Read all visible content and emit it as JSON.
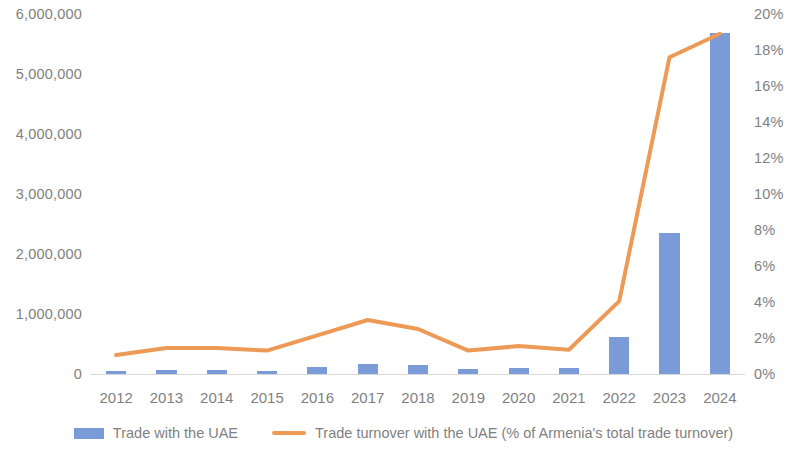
{
  "chart_data": {
    "type": "bar",
    "title": "",
    "subtitle": "",
    "xlabel": "",
    "ylabel": "",
    "y2label": "",
    "grid": false,
    "legend_position": "bottom",
    "categories": [
      "2012",
      "2013",
      "2014",
      "2015",
      "2016",
      "2017",
      "2018",
      "2019",
      "2020",
      "2021",
      "2022",
      "2023",
      "2024"
    ],
    "axes": {
      "left": {
        "min": 0,
        "max": 6000000,
        "step": 1000000,
        "ticks": [
          "0",
          "1,000,000",
          "2,000,000",
          "3,000,000",
          "4,000,000",
          "5,000,000",
          "6,000,000"
        ],
        "tick_values": [
          0,
          1000000,
          2000000,
          3000000,
          4000000,
          5000000,
          6000000
        ]
      },
      "right": {
        "min": 0,
        "max": 20,
        "step": 2,
        "ticks": [
          "0%",
          "2%",
          "4%",
          "6%",
          "8%",
          "10%",
          "12%",
          "14%",
          "16%",
          "18%",
          "20%"
        ],
        "tick_values": [
          0,
          2,
          4,
          6,
          8,
          10,
          12,
          14,
          16,
          18,
          20
        ]
      }
    },
    "series": [
      {
        "name": "Trade with the UAE",
        "type": "bar",
        "axis": "left",
        "color": "#7a9ad8",
        "values": [
          45000,
          70000,
          75000,
          48000,
          110000,
          165000,
          150000,
          90000,
          100000,
          95000,
          620000,
          2350000,
          5680000
        ]
      },
      {
        "name": "Trade turnover with the UAE (% of Armenia's total trade turnover)",
        "type": "line",
        "axis": "right",
        "color": "#ed9a56",
        "values": [
          1.05,
          1.45,
          1.45,
          1.3,
          2.15,
          3.0,
          2.5,
          1.3,
          1.55,
          1.35,
          4.05,
          17.6,
          18.9
        ]
      }
    ]
  },
  "legend": {
    "items": [
      {
        "label": "Trade with the UAE",
        "marker": "bar-swatch",
        "color": "#7a9ad8"
      },
      {
        "label": "Trade turnover with the UAE (% of Armenia's total trade turnover)",
        "marker": "line-swatch",
        "color": "#ed9a56"
      }
    ]
  }
}
